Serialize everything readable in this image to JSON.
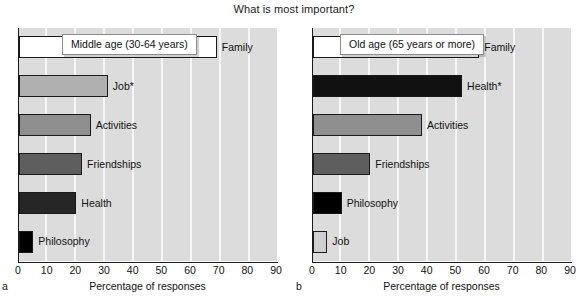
{
  "figure": {
    "title": "What is most important?"
  },
  "axis": {
    "xlabel": "Percentage of responses",
    "ticks": [
      "0",
      "10",
      "20",
      "30",
      "40",
      "50",
      "60",
      "70",
      "80",
      "90"
    ],
    "xmin": 0,
    "xmax": 90
  },
  "panels": [
    {
      "letter": "a",
      "caption": "Middle age (30-64 years)",
      "bars": [
        {
          "label": "Family",
          "value": 69,
          "color": "#ffffff"
        },
        {
          "label": "Job*",
          "value": 31,
          "color": "#b0b0b0"
        },
        {
          "label": "Activities",
          "value": 25,
          "color": "#8f8f8f"
        },
        {
          "label": "Friendships",
          "value": 22,
          "color": "#5e5e5e"
        },
        {
          "label": "Health",
          "value": 20,
          "color": "#262626"
        },
        {
          "label": "Philosophy",
          "value": 5,
          "color": "#000000"
        }
      ]
    },
    {
      "letter": "b",
      "caption": "Old age (65 years or more)",
      "bars": [
        {
          "label": "Family",
          "value": 58,
          "color": "#ffffff"
        },
        {
          "label": "Health*",
          "value": 52,
          "color": "#111111"
        },
        {
          "label": "Activities",
          "value": 38,
          "color": "#8f8f8f"
        },
        {
          "label": "Friendships",
          "value": 20,
          "color": "#5e5e5e"
        },
        {
          "label": "Philosophy",
          "value": 10,
          "color": "#000000"
        },
        {
          "label": "Job",
          "value": 5,
          "color": "#cfcfcf"
        }
      ]
    }
  ],
  "chart_data": {
    "type": "bar",
    "orientation": "horizontal",
    "title": "What is most important?",
    "xlabel": "Percentage of responses",
    "ylabel": "",
    "xlim": [
      0,
      90
    ],
    "xticks": [
      0,
      10,
      20,
      30,
      40,
      50,
      60,
      70,
      80,
      90
    ],
    "grid": "vertical",
    "legend": "none",
    "panels": [
      {
        "panel": "a",
        "annotation": "Middle age (30-64 years)",
        "categories": [
          "Family",
          "Job*",
          "Activities",
          "Friendships",
          "Health",
          "Philosophy"
        ],
        "values": [
          69,
          31,
          25,
          22,
          20,
          5
        ]
      },
      {
        "panel": "b",
        "annotation": "Old age (65 years or more)",
        "categories": [
          "Family",
          "Health*",
          "Activities",
          "Friendships",
          "Philosophy",
          "Job"
        ],
        "values": [
          58,
          52,
          38,
          20,
          10,
          5
        ]
      }
    ]
  }
}
